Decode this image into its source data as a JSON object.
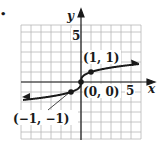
{
  "bullet": "•",
  "chart_data": {
    "type": "line",
    "title": "",
    "function": "y = cube root of x",
    "xlabel": "x",
    "ylabel": "y",
    "xlim": [
      -6,
      6
    ],
    "ylim": [
      -5.7,
      5.7
    ],
    "grid": true,
    "tick_labels": {
      "x": [
        "5"
      ],
      "y": [
        "5"
      ]
    },
    "points": [
      {
        "x": -1,
        "y": -1,
        "label": "(−1, −1)"
      },
      {
        "x": 0,
        "y": 0,
        "label": "(0, 0)"
      },
      {
        "x": 1,
        "y": 1,
        "label": "(1, 1)"
      }
    ],
    "series": [
      {
        "name": "cube root",
        "x": [
          -5.8,
          -4,
          -2,
          -1,
          -0.5,
          -0.1,
          0,
          0.1,
          0.5,
          1,
          2,
          4,
          5.8
        ],
        "values": [
          -1.8,
          -1.59,
          -1.26,
          -1,
          -0.79,
          -0.46,
          0,
          0.46,
          0.79,
          1,
          1.26,
          1.59,
          1.8
        ]
      }
    ]
  },
  "labels": {
    "x_axis": "x",
    "y_axis": "y",
    "x_tick_5": "5",
    "y_tick_5": "5",
    "point_origin": "(0, 0)",
    "point_pos": "(1, 1)",
    "point_neg": "(−1, −1)"
  },
  "colors": {
    "grid": "#b8b8b8",
    "axis": "#1a1a1a",
    "curve": "#1a1a1a"
  }
}
